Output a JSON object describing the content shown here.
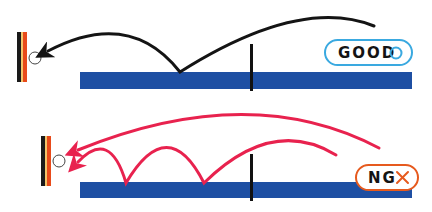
{
  "diagram": {
    "colors": {
      "table": "#1e4fa3",
      "net": "#111111",
      "good_arc": "#141414",
      "ng_arc": "#e8224e",
      "good_badge": "#3aa9e0",
      "ng_badge": "#e65a1e",
      "paddle_black": "#1a1a1a",
      "paddle_yellow": "#f2c46a",
      "paddle_red": "#e84a1a"
    },
    "panels": [
      {
        "id": "good",
        "badge_text": "GOOD",
        "badge_symbol": "○",
        "description": "Ball bounces once on the near side and travels to the paddle in one arc"
      },
      {
        "id": "ng",
        "badge_text": "NG",
        "badge_symbol": "×",
        "description": "Ball bounces multiple times or flies over without proper bounce"
      }
    ]
  }
}
